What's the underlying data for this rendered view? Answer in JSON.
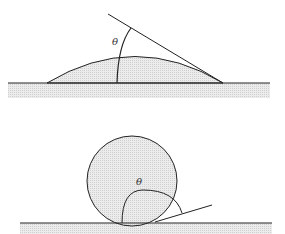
{
  "figure": {
    "top": {
      "caption": "Droplet on wetting surface (small contact angle)",
      "angle_label": "θ"
    },
    "bottom": {
      "caption": "Droplet on non-wetting surface (large contact angle)",
      "angle_label": "θ"
    }
  },
  "colors": {
    "stroke": "#222222",
    "fill": "#e4e4e4",
    "substrate": "#e0e0e0"
  }
}
